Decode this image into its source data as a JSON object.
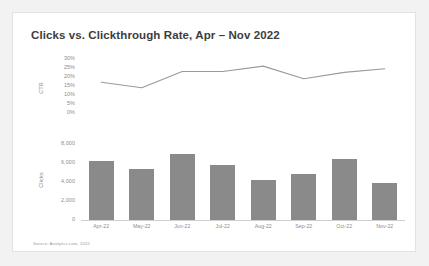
{
  "card": {
    "title": "Clicks vs. Clickthrough Rate, Apr – Nov 2022",
    "source": "Source: Analytics.com, 2022",
    "background": "#ffffff",
    "page_background": "#f2f2f2",
    "border_color": "#e2e2e2"
  },
  "chart_data": {
    "type": "bar",
    "title": "Clicks vs. Clickthrough Rate, Apr – Nov 2022",
    "xlabel": "",
    "categories": [
      "Apr-22",
      "May-22",
      "Jun-22",
      "Jul-22",
      "Aug-22",
      "Sep-22",
      "Oct-22",
      "Nov-22"
    ],
    "grid": false,
    "legend": "none",
    "panels": [
      {
        "name": "ctr",
        "type": "line",
        "ylabel": "CTR",
        "ylim": [
          0,
          30
        ],
        "yticks": [
          "30%",
          "25%",
          "20%",
          "15%",
          "10%",
          "5%",
          "0%"
        ],
        "ytick_values": [
          30,
          25,
          20,
          15,
          10,
          5,
          0
        ],
        "values": [
          16.5,
          13.5,
          22.5,
          22.5,
          25.5,
          18.5,
          22.0,
          24.0
        ],
        "line_color": "#9a9a9a"
      },
      {
        "name": "clicks",
        "type": "bar",
        "ylabel": "Clicks",
        "ylim": [
          0,
          8000
        ],
        "yticks": [
          "8,000",
          "6,000",
          "4,000",
          "2,000",
          "0"
        ],
        "ytick_values": [
          8000,
          6000,
          4000,
          2000,
          0
        ],
        "values": [
          6000,
          5200,
          6700,
          5600,
          4100,
          4700,
          6200,
          3800
        ],
        "bar_color": "#8a8a8a"
      }
    ]
  }
}
